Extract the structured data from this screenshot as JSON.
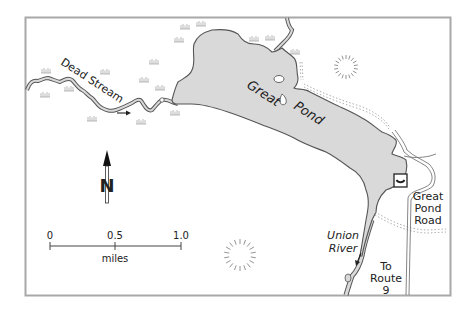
{
  "map": {
    "colors": {
      "water": "#d9d9d9",
      "shoreline": "#555555",
      "frame": "#a8a8a8",
      "road": "#777777",
      "trail": "#999999",
      "marsh": "#aaaaaa",
      "text": "#222222"
    },
    "labels": {
      "stream": "Dead Stream",
      "pond_word1": "Great",
      "pond_word2": "Pond",
      "river_line1": "Union",
      "river_line2": "River",
      "road_line1": "Great",
      "road_line2": "Pond",
      "road_line3": "Road",
      "route_line1": "To",
      "route_line2": "Route",
      "route_line3": "9"
    },
    "north_arrow": {
      "letter": "N"
    },
    "scale_bar": {
      "ticks": [
        "0",
        "0.5",
        "1.0"
      ],
      "unit": "miles"
    },
    "symbols": {
      "boat_launch": "boat-launch-icon",
      "hills": [
        "hill-icon",
        "hill-icon"
      ],
      "marsh": "marsh-icon",
      "flow_arrows": [
        "flow-arrow-east",
        "flow-arrow-south"
      ]
    }
  }
}
